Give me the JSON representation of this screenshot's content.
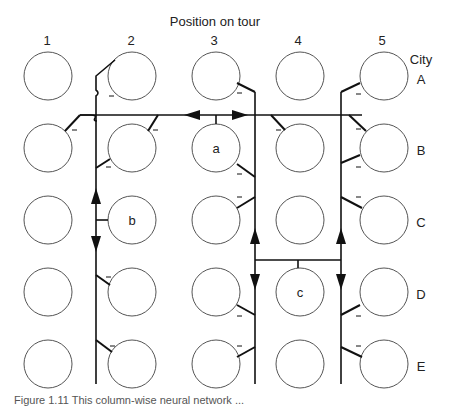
{
  "header": {
    "title": "Position on tour",
    "positions": [
      "1",
      "2",
      "3",
      "4",
      "5"
    ],
    "city_heading": "City",
    "cities": [
      "A",
      "B",
      "C",
      "D",
      "E"
    ]
  },
  "neurons": {
    "labels": {
      "a": {
        "text": "a",
        "col": 3,
        "row": "B"
      },
      "b": {
        "text": "b",
        "col": 2,
        "row": "C"
      },
      "c": {
        "text": "c",
        "col": 4,
        "row": "D"
      }
    },
    "inhibitory_mark": "–"
  },
  "colors": {
    "circle_stroke": "#555555",
    "line": "#111111",
    "background": "#ffffff"
  },
  "caption": "Figure 1.11  This column-wise neural network ..."
}
